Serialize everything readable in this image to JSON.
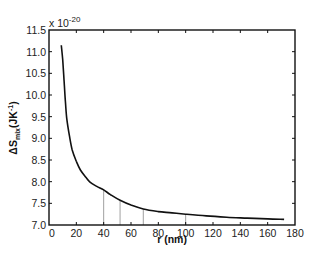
{
  "chart_data": {
    "type": "line",
    "title": "",
    "xlabel": "r (nm)",
    "ylabel": "ΔS_mix (JK⁻¹)",
    "ylabel_parts": {
      "delta": "Δ",
      "symbol": "S",
      "subscript": "mix",
      "units": "(JK",
      "units_sup": "-1",
      "units_close": ")"
    },
    "y_multiplier": {
      "prefix": "x 10",
      "exponent": "-20"
    },
    "xlim": [
      0,
      180
    ],
    "ylim": [
      7.0,
      11.5
    ],
    "grid": false,
    "legend": null,
    "x_ticks": [
      0,
      20,
      40,
      60,
      80,
      100,
      120,
      140,
      160,
      180
    ],
    "y_ticks": [
      7.0,
      7.5,
      8.0,
      8.5,
      9.0,
      9.5,
      10.0,
      10.5,
      11.0,
      11.5
    ],
    "x_tick_labels": [
      "0",
      "20",
      "40",
      "60",
      "80",
      "100",
      "120",
      "140",
      "160",
      "180"
    ],
    "y_tick_labels": [
      "7.0",
      "7.5",
      "8.0",
      "8.5",
      "9.0",
      "9.5",
      "10.0",
      "10.5",
      "11.0",
      "11.5"
    ],
    "series": [
      {
        "name": "ΔS_mix",
        "x": [
          9,
          10,
          11,
          12,
          13,
          15,
          17,
          20,
          23,
          27,
          30,
          35,
          40,
          45,
          52,
          60,
          69,
          80,
          90,
          100,
          115,
          130,
          145,
          160,
          172
        ],
        "values": [
          11.15,
          10.82,
          10.35,
          9.85,
          9.45,
          9.05,
          8.73,
          8.47,
          8.27,
          8.1,
          7.99,
          7.89,
          7.81,
          7.7,
          7.57,
          7.46,
          7.37,
          7.31,
          7.28,
          7.25,
          7.21,
          7.18,
          7.16,
          7.14,
          7.13
        ]
      }
    ],
    "annotations": {
      "vertical_markers_x": [
        40,
        52,
        69,
        100
      ]
    }
  }
}
